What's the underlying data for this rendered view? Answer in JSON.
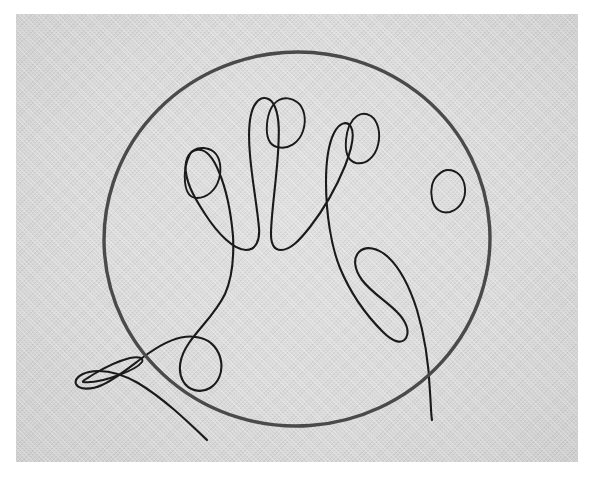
{
  "artwork": {
    "title": "Contour line drawing of a hand with a circle",
    "medium": "ink line drawing on textured paper",
    "style": "single-line contour sketch",
    "alt_text": "A continuous-line drawing of an open left hand with five fingers and visible fingernails, overlaid by a large hand-drawn circle, on gray textured paper"
  },
  "canvas": {
    "width": 596,
    "height": 477,
    "background_color": "#ffffff"
  },
  "paper": {
    "x": 16,
    "y": 14,
    "width": 562,
    "height": 448,
    "color": "#d6d6d6",
    "texture": "woven-paper-grain"
  },
  "ink": {
    "hand_color": "#1a1a1a",
    "circle_color": "#4a4a4a",
    "hand_stroke_width": 2.1,
    "circle_stroke_width": 3.4
  },
  "circle": {
    "name": "hand-drawn-circle",
    "center_x": 297,
    "center_y": 239,
    "radius_x": 193,
    "radius_y": 187,
    "rotation_deg": -4
  },
  "elements": [
    {
      "id": "thumb",
      "label": "Thumb",
      "nail": "sliver-oval"
    },
    {
      "id": "index",
      "label": "Index finger",
      "nail": "rounded-square"
    },
    {
      "id": "middle",
      "label": "Middle finger",
      "nail": "rounded-square"
    },
    {
      "id": "ring",
      "label": "Ring finger",
      "nail": "rounded-oval"
    },
    {
      "id": "pinky",
      "label": "Little finger",
      "nail": "tilted-oval"
    }
  ],
  "paths": {
    "hand_outline": "M 207 440 C 186 420 163 398 138 383 C 122 374 104 369 89 372 C 80 374 74 379 76 384 C 79 390 91 390 102 385 C 118 378 133 364 149 353 C 166 341 185 333 201 338 C 212 341 219 350 221 361 C 223 373 218 383 210 388 C 200 394 188 390 183 381 C 177 370 180 356 189 343 C 200 327 216 313 225 294 C 233 276 234 256 233 236 C 231 213 227 191 219 172 C 213 157 205 148 196 150 C 188 152 184 162 186 173 C 188 187 196 200 205 214 C 218 234 234 250 246 250 C 256 250 260 240 259 228 C 257 205 252 180 250 155 C 248 132 249 112 256 103 C 262 95 271 97 275 107 C 280 119 279 136 278 153 C 276 184 271 215 271 234 C 271 244 274 250 281 250 C 290 250 299 241 310 227 C 324 209 336 188 345 166 C 352 148 355 134 351 127 C 347 120 339 123 334 133 C 328 145 326 163 326 182 C 326 213 331 246 340 268 C 352 297 369 318 383 332 C 394 343 402 344 406 338 C 410 331 406 321 397 312 C 386 301 371 292 362 280 C 354 269 353 258 359 252 C 366 245 378 248 388 257 C 401 269 410 288 417 310 C 425 337 429 368 430 392 C 431 406 431 415 432 420",
    "nail_thumb": "M 83 382 C 92 383 106 380 119 375 C 130 371 139 366 142 362 C 144 358 139 356 130 358 C 118 361 104 368 94 374 C 86 379 82 381 83 382 Z",
    "nail_index": "M 190 154 C 186 162 184 172 185 182 C 186 192 190 198 197 198 C 207 198 216 190 219 179 C 222 168 220 157 214 152 C 208 147 199 147 194 150 C 192 151 191 152 190 154 Z",
    "nail_middle": "M 279 100 C 272 104 268 113 267 124 C 266 136 269 145 277 147 C 288 150 299 143 303 131 C 307 119 304 107 297 102 C 292 98 284 97 279 100 Z",
    "nail_ring": "M 357 116 C 351 120 347 129 346 140 C 345 152 348 161 356 163 C 366 165 375 157 378 145 C 381 133 378 121 371 116 C 366 113 361 113 357 116 Z",
    "nail_pinky": "M 438 175 C 432 180 430 190 432 199 C 434 209 441 214 450 212 C 460 209 466 199 465 188 C 464 177 457 170 448 170 C 444 170 441 172 438 175 Z"
  }
}
